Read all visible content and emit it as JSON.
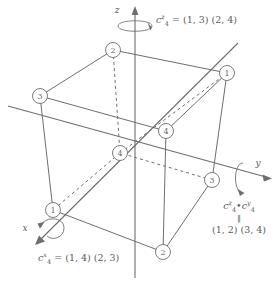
{
  "figure": {
    "background_color": "#ffffff",
    "line_color": "#6e6e6e",
    "text_color": "#5a5a5a"
  },
  "axes": [
    {
      "name": "z",
      "label": "z",
      "direction": "up"
    },
    {
      "name": "y",
      "label": "y",
      "direction": "right"
    },
    {
      "name": "x",
      "label": "x",
      "direction": "down-left"
    }
  ],
  "vertices": [
    {
      "id": "v-top",
      "label": "2",
      "x": 113,
      "y": 50
    },
    {
      "id": "v-top-right",
      "label": "1",
      "x": 227,
      "y": 73
    },
    {
      "id": "v-left",
      "label": "3",
      "x": 40,
      "y": 96
    },
    {
      "id": "v-back-right",
      "label": "4",
      "x": 166,
      "y": 131
    },
    {
      "id": "v-center",
      "label": "4",
      "x": 120,
      "y": 153
    },
    {
      "id": "v-right",
      "label": "3",
      "x": 212,
      "y": 180
    },
    {
      "id": "v-bottom-left",
      "label": "1",
      "x": 53,
      "y": 210
    },
    {
      "id": "v-bottom",
      "label": "2",
      "x": 163,
      "y": 252
    }
  ],
  "annotations": {
    "z_rotation": {
      "name": "c4z-permutation",
      "symbol_base": "c",
      "symbol_sub": "4",
      "symbol_sup": "z",
      "equals": "=",
      "cycles": "(1, 3) (2, 4)",
      "full_text": "c4z = (1, 3)(2, 4)"
    },
    "x_rotation": {
      "name": "c4x-permutation",
      "symbol_base": "c",
      "symbol_sub": "4",
      "symbol_sup": "x",
      "equals": "=",
      "cycles": "(1, 4) (2, 3)",
      "full_text": "c4x = (1, 4)(2, 3)"
    },
    "product": {
      "name": "c4z-times-c4y-product",
      "line1_base1": "c",
      "line1_sub1": "4",
      "line1_sup1": "z",
      "line1_op": "•",
      "line1_base2": "c",
      "line1_sub2": "4",
      "line1_sup2": "y",
      "line2": "‖",
      "line3": "(1, 2) (3, 4)",
      "full_text": "c4z • c4y ‖ (1, 2)(3, 4)"
    }
  }
}
